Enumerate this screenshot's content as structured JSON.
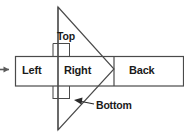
{
  "diagram": {
    "background_color": "#ffffff",
    "line_color": "#3a3a3a",
    "text_color": "#1a1a1a",
    "labels": {
      "left": "Left",
      "right": "Right",
      "back": "Back",
      "top": "Top",
      "bottom": "Bottom"
    },
    "watermark": "",
    "shapes": {
      "triangle": {
        "name": "projection-triangle",
        "apex_top": [
          58,
          7
        ],
        "apex_bottom": [
          58,
          130
        ],
        "point_right": [
          114,
          69
        ]
      },
      "band": {
        "name": "horizontal-band",
        "x": 15,
        "y": 56,
        "width": 169,
        "height": 30,
        "dividers": [
          58,
          114
        ]
      },
      "top_bracket": {
        "x": 53,
        "y": 43,
        "width": 17,
        "height": 13
      },
      "bottom_bracket": {
        "x": 53,
        "y": 86,
        "width": 17,
        "height": 13
      },
      "bottom_leader": {
        "from": [
          95,
          104
        ],
        "to": [
          74,
          96
        ]
      },
      "left_arrow": {
        "x": 0,
        "y": 69,
        "length": 10
      }
    }
  }
}
